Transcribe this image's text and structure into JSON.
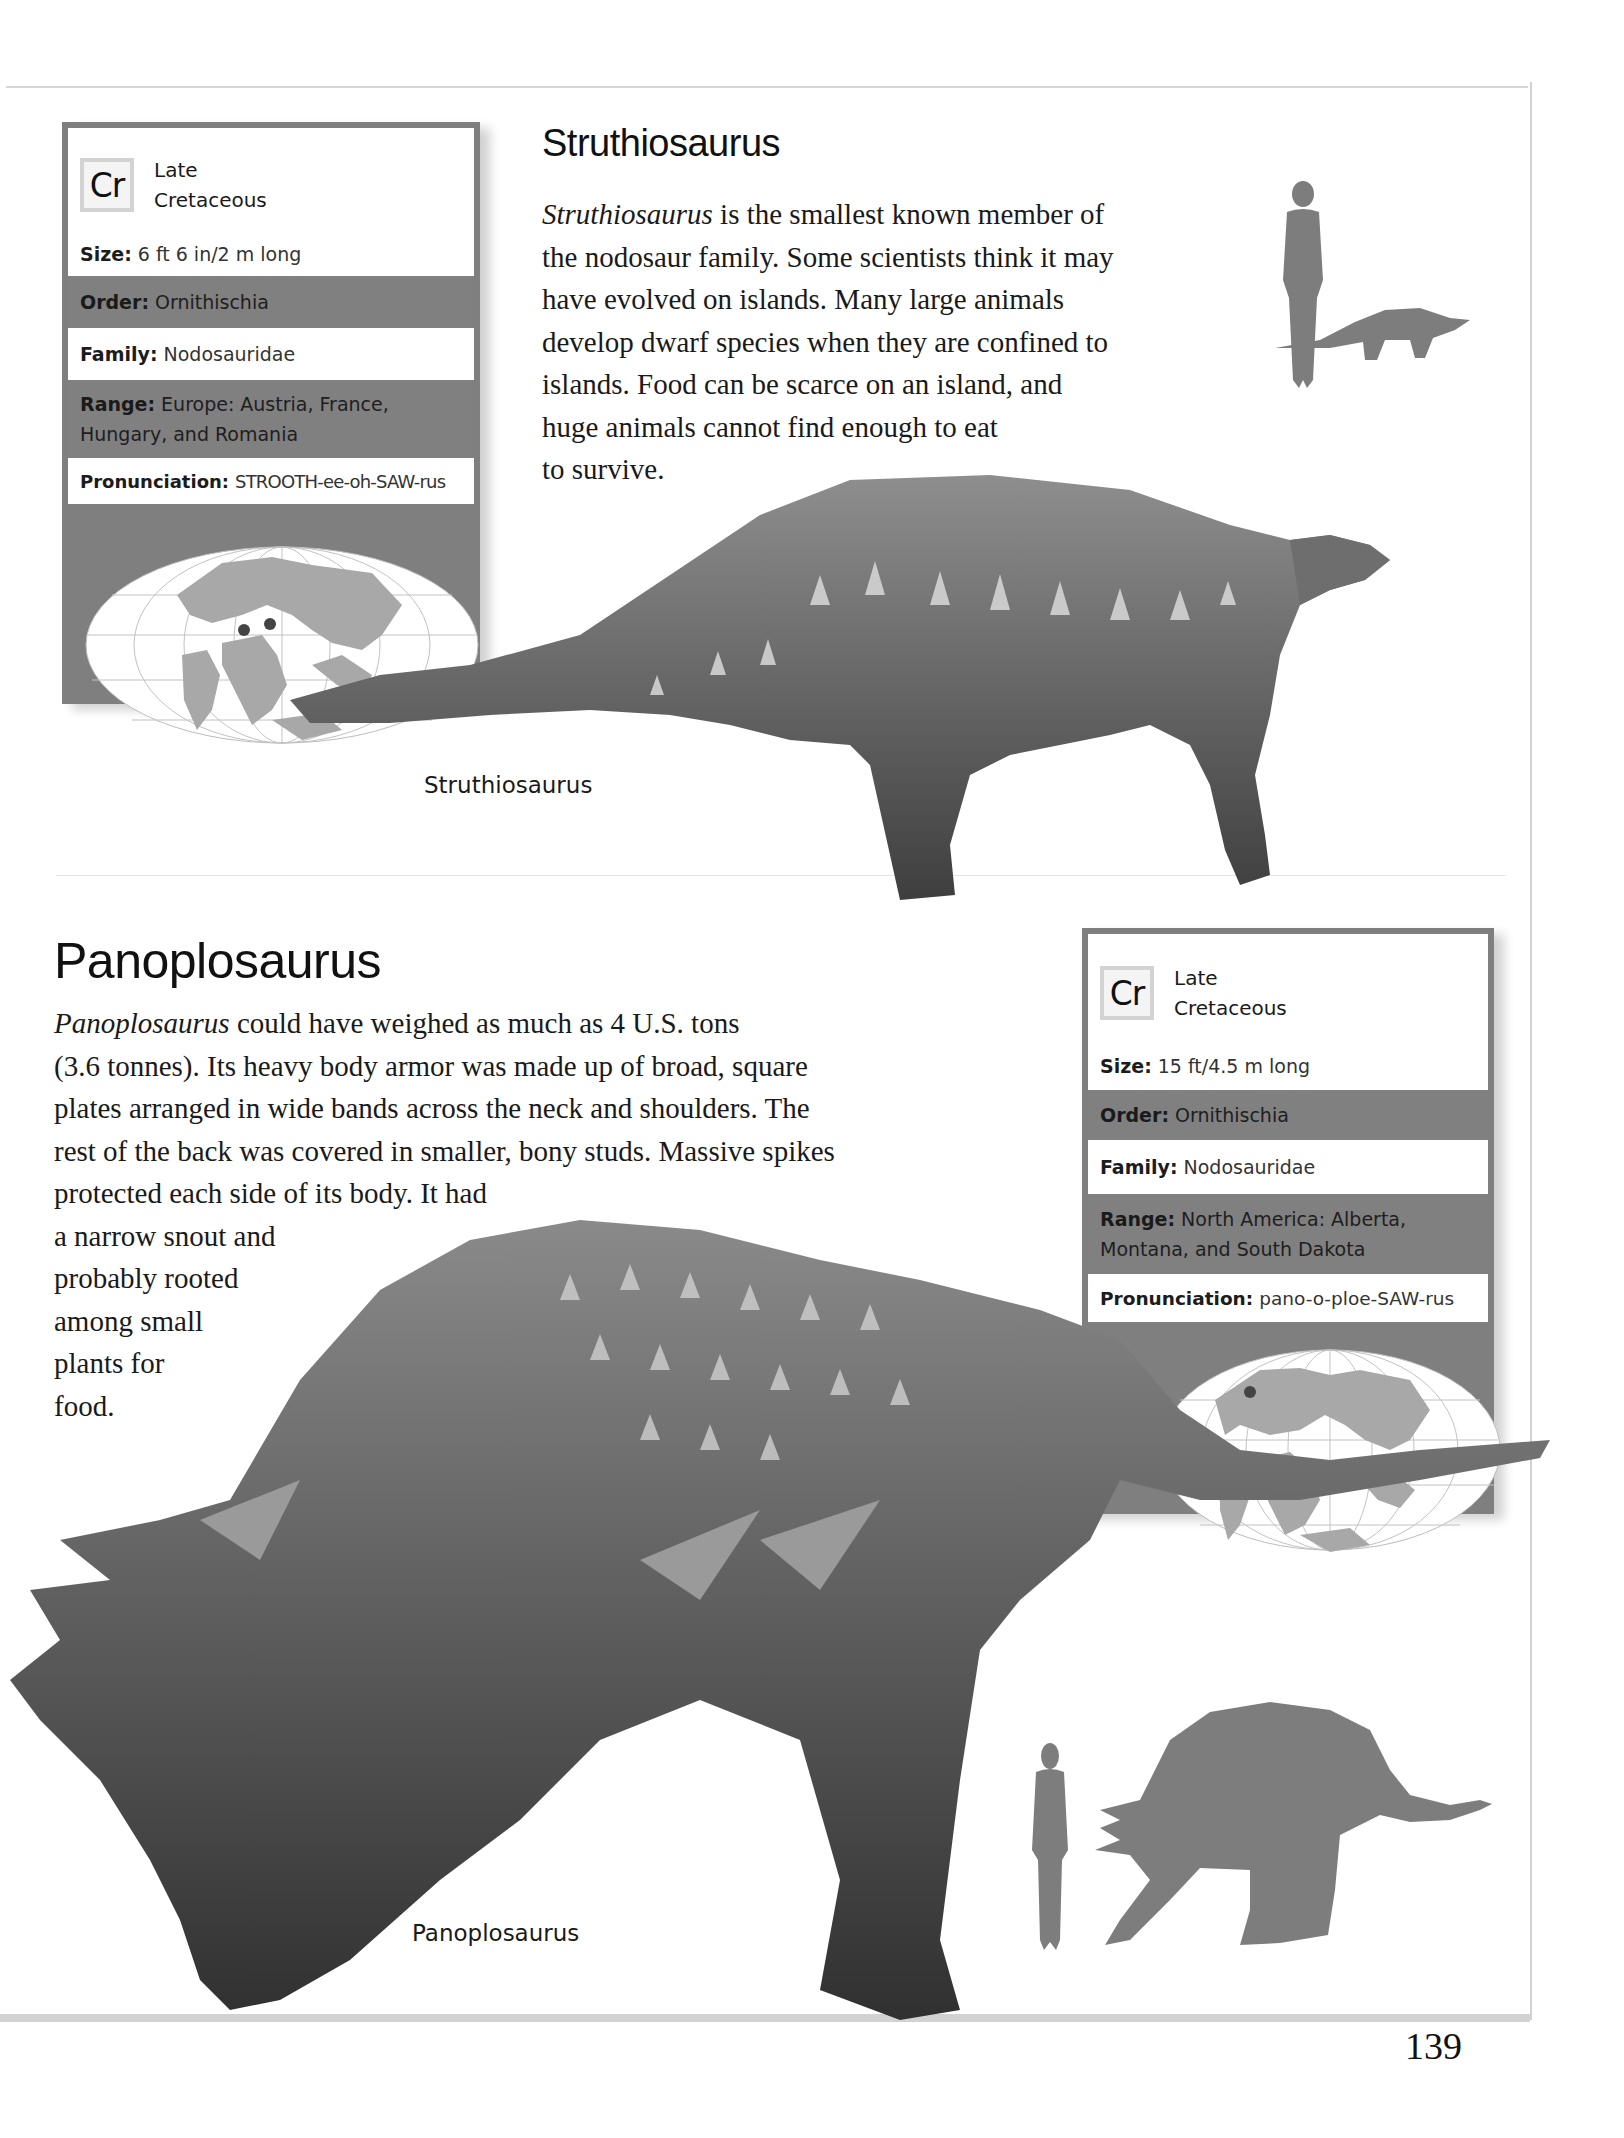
{
  "page": {
    "number": "139"
  },
  "struthiosaurus": {
    "title": "Struthiosaurus",
    "description_lines": [
      {
        "italic": "Struthiosaurus",
        "rest": " is the smallest known member of"
      },
      {
        "italic": "",
        "rest": "the nodosaur family. Some scientists think it may"
      },
      {
        "italic": "",
        "rest": "have evolved on islands. Many large animals"
      },
      {
        "italic": "",
        "rest": "develop dwarf species when they are confined to"
      },
      {
        "italic": "",
        "rest": "islands. Food can be scarce on an island, and"
      },
      {
        "italic": "",
        "rest": "huge animals cannot find enough to eat"
      },
      {
        "italic": "",
        "rest": "to survive."
      }
    ],
    "caption": "Struthiosaurus",
    "factfile": {
      "period_code": "Cr",
      "period_line1": "Late",
      "period_line2": "Cretaceous",
      "rows": [
        {
          "label": "Size:",
          "value": "6 ft 6 in/2 m long"
        },
        {
          "label": "Order:",
          "value": "Ornithischia"
        },
        {
          "label": "Family:",
          "value": "Nodosauridae"
        },
        {
          "label": "Range:",
          "value": "Europe: Austria, France,",
          "value2": "Hungary, and Romania"
        },
        {
          "label": "Pronunciation:",
          "value": "STROOTH-ee-oh-SAW-rus"
        }
      ],
      "map_markers": [
        "Austria",
        "Romania"
      ]
    },
    "scale_icons": [
      "human-silhouette",
      "struthiosaurus-silhouette"
    ]
  },
  "panoplosaurus": {
    "title": "Panoplosaurus",
    "description_lines": [
      {
        "italic": "Panoplosaurus",
        "rest": " could have weighed as much as 4 U.S. tons"
      },
      {
        "italic": "",
        "rest": "(3.6 tonnes). Its heavy body armor was made up of broad, square"
      },
      {
        "italic": "",
        "rest": "plates arranged in wide bands across the neck and shoulders. The"
      },
      {
        "italic": "",
        "rest": "rest of the back was covered in smaller, bony studs. Massive spikes"
      },
      {
        "italic": "",
        "rest": "protected each side of its body. It had"
      },
      {
        "italic": "",
        "rest": "a narrow snout and"
      },
      {
        "italic": "",
        "rest": "probably rooted"
      },
      {
        "italic": "",
        "rest": "among small"
      },
      {
        "italic": "",
        "rest": "plants for"
      },
      {
        "italic": "",
        "rest": "food."
      }
    ],
    "caption": "Panoplosaurus",
    "factfile": {
      "period_code": "Cr",
      "period_line1": "Late",
      "period_line2": "Cretaceous",
      "rows": [
        {
          "label": "Size:",
          "value": "15 ft/4.5 m long"
        },
        {
          "label": "Order:",
          "value": "Ornithischia"
        },
        {
          "label": "Family:",
          "value": "Nodosauridae"
        },
        {
          "label": "Range:",
          "value": "North America: Alberta,",
          "value2": "Montana, and South Dakota"
        },
        {
          "label": "Pronunciation:",
          "value": "pano-o-ploe-SAW-rus"
        }
      ],
      "map_markers": [
        "North America"
      ]
    },
    "scale_icons": [
      "human-silhouette",
      "panoplosaurus-silhouette"
    ]
  },
  "colors": {
    "factfile_grey": "#808080",
    "silhouette_grey": "#7d7d7d",
    "map_land": "#a9a9a9",
    "map_marker": "#4a4a4a"
  }
}
